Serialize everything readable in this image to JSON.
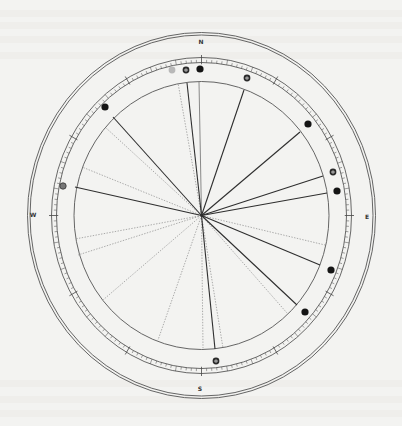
{
  "diagram": {
    "type": "circular-dial-chart",
    "center": {
      "x": 201.5,
      "y": 215.5
    },
    "colors": {
      "background": "#f3f3f1",
      "line": "#2e2e2e",
      "thin_line": "#5a5a5a",
      "dotted_line": "#8a8a8a",
      "marker_solid": "#151515",
      "marker_light": "#b8b8b8"
    },
    "rings": {
      "outer_double": {
        "rx1": 174,
        "ry1": 183,
        "rx2": 171.5,
        "ry2": 180.5
      },
      "scale_outer": {
        "rx": 150,
        "ry": 158
      },
      "scale_inner": {
        "rx": 145,
        "ry": 153
      },
      "inner_circle": {
        "rx": 127.5,
        "ry": 134
      }
    },
    "scale": {
      "minor_ticks": 180,
      "major_every": 5,
      "labeled_every": 15
    },
    "cardinals": [
      {
        "label": "N",
        "x": 201,
        "y": 44
      },
      {
        "label": "S",
        "x": 200,
        "y": 391
      },
      {
        "label": "E",
        "x": 367,
        "y": 219
      },
      {
        "label": "W",
        "x": 33,
        "y": 217
      }
    ],
    "solid_lines": [
      {
        "x": 113,
        "y": 117
      },
      {
        "x": 187,
        "y": 83
      },
      {
        "x": 244,
        "y": 90
      },
      {
        "x": 300,
        "y": 132
      },
      {
        "x": 323,
        "y": 176
      },
      {
        "x": 327,
        "y": 193
      },
      {
        "x": 75,
        "y": 187
      },
      {
        "x": 320,
        "y": 265
      },
      {
        "x": 297,
        "y": 305
      },
      {
        "x": 215,
        "y": 349
      }
    ],
    "thin_lines": [
      {
        "x": 199,
        "y": 82
      }
    ],
    "dotted_lines": [
      {
        "x": 105,
        "y": 127
      },
      {
        "x": 82,
        "y": 167
      },
      {
        "x": 178,
        "y": 83
      },
      {
        "x": 325,
        "y": 245
      },
      {
        "x": 75,
        "y": 239
      },
      {
        "x": 78,
        "y": 255
      },
      {
        "x": 103,
        "y": 300
      },
      {
        "x": 158,
        "y": 340
      },
      {
        "x": 203,
        "y": 348
      },
      {
        "x": 223,
        "y": 348
      },
      {
        "x": 287,
        "y": 313
      }
    ],
    "markers": [
      {
        "x": 172,
        "y": 70,
        "style": "light"
      },
      {
        "x": 186,
        "y": 70,
        "style": "ringed"
      },
      {
        "x": 200,
        "y": 69,
        "style": "solid"
      },
      {
        "x": 247,
        "y": 78,
        "style": "ringed"
      },
      {
        "x": 105,
        "y": 107,
        "style": "solid"
      },
      {
        "x": 308,
        "y": 124,
        "style": "solid"
      },
      {
        "x": 333,
        "y": 172,
        "style": "ringed"
      },
      {
        "x": 337,
        "y": 191,
        "style": "solid"
      },
      {
        "x": 63,
        "y": 186,
        "style": "ringed-gray"
      },
      {
        "x": 331,
        "y": 270,
        "style": "solid"
      },
      {
        "x": 305,
        "y": 312,
        "style": "solid"
      },
      {
        "x": 216,
        "y": 361,
        "style": "ringed"
      }
    ]
  }
}
